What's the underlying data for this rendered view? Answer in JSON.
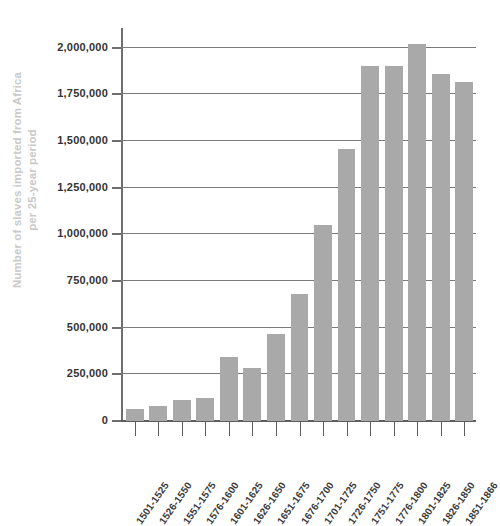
{
  "chart_data": {
    "type": "bar",
    "title": "",
    "xlabel": "",
    "ylabel": "Number of slaves imported from Africa per 25-year period",
    "ylabel_line1": "Number of slaves imported from Africa",
    "ylabel_line2": "per 25-year period",
    "ylim": [
      0,
      2100000
    ],
    "grid": true,
    "legend": "none",
    "bar_color": "#a9a9a9",
    "axis_color": "#6e6e6e",
    "gridline_color": "#7a7a7a",
    "tick_label_color": "#333333",
    "ylabel_color": "#c9c9c9",
    "ytick_labels": [
      "0",
      "250,000",
      "500,000",
      "750,000",
      "1,000,000",
      "1,250,000",
      "1,500,000",
      "1,750,000",
      "2,000,000"
    ],
    "ytick_values": [
      0,
      250000,
      500000,
      750000,
      1000000,
      1250000,
      1500000,
      1750000,
      2000000
    ],
    "categories": [
      "1501-1525",
      "1526-1550",
      "1551-1575",
      "1576-1600",
      "1601-1625",
      "1626-1650",
      "1651-1675",
      "1676-1700",
      "1701-1725",
      "1726-1750",
      "1751-1775",
      "1776-1800",
      "1801-1825",
      "1826-1850",
      "1851-1866"
    ],
    "values": [
      65000,
      80000,
      110000,
      125000,
      345000,
      285000,
      465000,
      680000,
      1050000,
      1455000,
      1900000,
      1900000,
      2020000,
      1860000,
      1815000
    ]
  }
}
